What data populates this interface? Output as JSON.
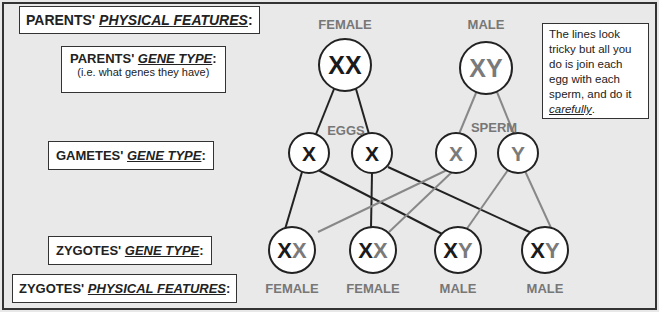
{
  "labels": {
    "parents_physical": {
      "prefix": "PARENTS' ",
      "emph": "PHYSICAL FEATURES",
      "suffix": ":"
    },
    "parents_gene": {
      "prefix": "PARENTS' ",
      "emph": "GENE TYPE",
      "suffix": ":",
      "sub": "(i.e. what genes they have)"
    },
    "gametes_gene": {
      "prefix": "GAMETES' ",
      "emph": "GENE TYPE",
      "suffix": ":"
    },
    "zygotes_gene": {
      "prefix": "ZYGOTES' ",
      "emph": "GENE TYPE",
      "suffix": ":"
    },
    "zygotes_physical": {
      "prefix": "ZYGOTES' ",
      "emph": "PHYSICAL FEATURES",
      "suffix": ":"
    }
  },
  "parents": {
    "female": {
      "caption": "FEMALE",
      "genes": "XX"
    },
    "male": {
      "caption": "MALE",
      "genes": "XY"
    }
  },
  "gametes": {
    "eggs_caption": "EGGS",
    "sperm_caption": "SPERM",
    "eggs": [
      "X",
      "X"
    ],
    "sperm": [
      "X",
      "Y"
    ]
  },
  "zygotes": [
    {
      "a": "X",
      "b": "X",
      "sex": "FEMALE"
    },
    {
      "a": "X",
      "b": "X",
      "sex": "FEMALE"
    },
    {
      "a": "X",
      "b": "Y",
      "sex": "MALE"
    },
    {
      "a": "X",
      "b": "Y",
      "sex": "MALE"
    }
  ],
  "note": {
    "text": "The lines look tricky but all you do is join each egg with each sperm, and do it ",
    "emph": "carefully",
    "end": "."
  },
  "colors": {
    "female_line": "#222222",
    "male_line": "#808080",
    "male_gene": "#7a7a7a"
  }
}
